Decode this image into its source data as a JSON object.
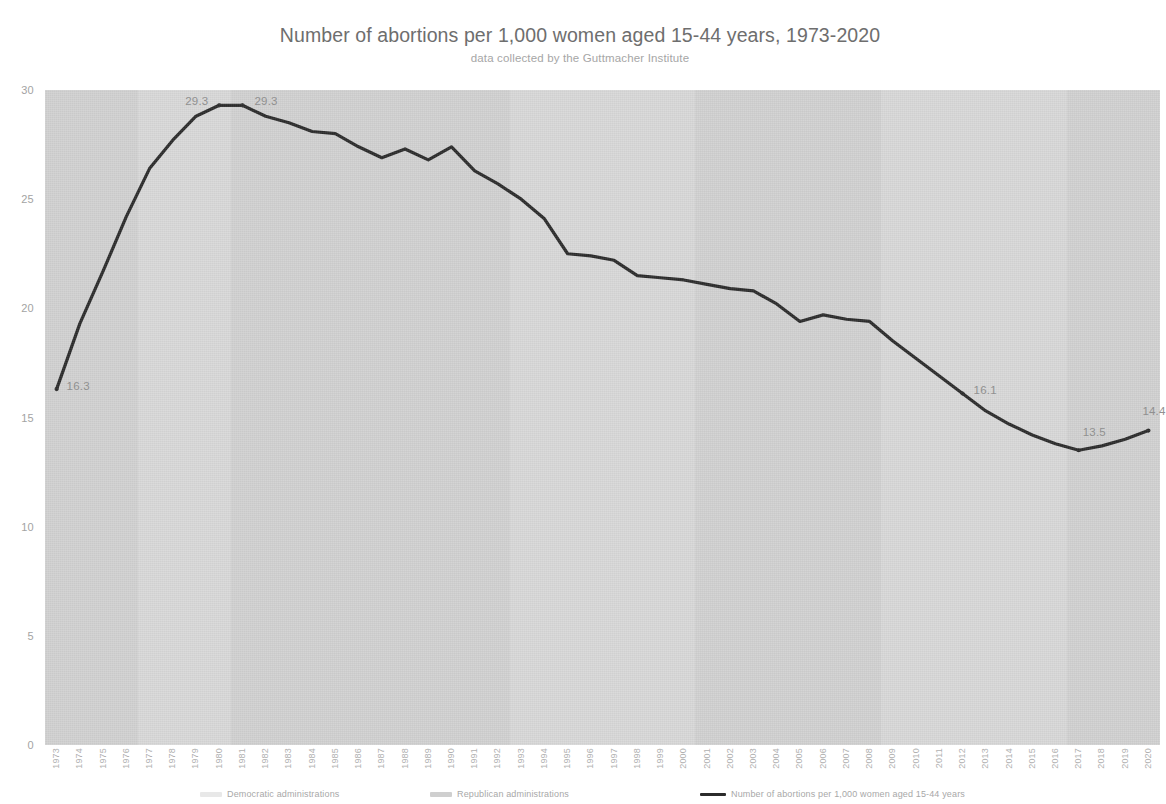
{
  "header": {
    "title": "Number of abortions per 1,000 women aged 15-44 years, 1973-2020",
    "subtitle": "data collected by the Guttmacher Institute"
  },
  "legend": [
    {
      "label": "Democratic administrations",
      "marker": "band-swatch",
      "color": "#e8e8e8"
    },
    {
      "label": "Republican administrations",
      "marker": "band-swatch",
      "color": "#cfcfcf"
    },
    {
      "label": "Number of abortions per 1,000 women aged 15-44 years",
      "marker": "line-swatch",
      "color": "#2b2b2b"
    }
  ],
  "colors": {
    "plot_background": "#d6d6d6",
    "line": "#2b2b2b",
    "axis_text": "#a8a8a8",
    "title_text": "#6e6e6e"
  },
  "chart_data": {
    "type": "line",
    "title": "Number of abortions per 1,000 women aged 15-44 years, 1973-2020",
    "subtitle": "data collected by the Guttmacher Institute",
    "xlabel": "",
    "ylabel": "",
    "ylim": [
      0,
      30
    ],
    "yticks": [
      0,
      5,
      10,
      15,
      20,
      25,
      30
    ],
    "ytick_labels": [
      "0",
      "5",
      "10",
      "15",
      "20",
      "25",
      "30"
    ],
    "grid": false,
    "legend_position": "bottom",
    "x": [
      1973,
      1974,
      1975,
      1976,
      1977,
      1978,
      1979,
      1980,
      1981,
      1982,
      1983,
      1984,
      1985,
      1986,
      1987,
      1988,
      1989,
      1990,
      1991,
      1992,
      1993,
      1994,
      1995,
      1996,
      1997,
      1998,
      1999,
      2000,
      2001,
      2002,
      2003,
      2004,
      2005,
      2006,
      2007,
      2008,
      2009,
      2010,
      2011,
      2012,
      2013,
      2014,
      2015,
      2016,
      2017,
      2018,
      2019,
      2020
    ],
    "categories": [
      "1973",
      "1974",
      "1975",
      "1976",
      "1977",
      "1978",
      "1979",
      "1980",
      "1981",
      "1982",
      "1983",
      "1984",
      "1985",
      "1986",
      "1987",
      "1988",
      "1989",
      "1990",
      "1991",
      "1992",
      "1993",
      "1994",
      "1995",
      "1996",
      "1997",
      "1998",
      "1999",
      "2000",
      "2001",
      "2002",
      "2003",
      "2004",
      "2005",
      "2006",
      "2007",
      "2008",
      "2009",
      "2010",
      "2011",
      "2012",
      "2013",
      "2014",
      "2015",
      "2016",
      "2017",
      "2018",
      "2019",
      "2020"
    ],
    "series": [
      {
        "name": "Number of abortions per 1,000 women aged 15-44 years",
        "color": "#2b2b2b",
        "values": [
          16.3,
          19.3,
          21.7,
          24.2,
          26.4,
          27.7,
          28.8,
          29.3,
          29.3,
          28.8,
          28.5,
          28.1,
          28.0,
          27.4,
          26.9,
          27.3,
          26.8,
          27.4,
          26.3,
          25.7,
          25.0,
          24.1,
          22.5,
          22.4,
          22.2,
          21.5,
          21.4,
          21.3,
          21.1,
          20.9,
          20.8,
          20.2,
          19.4,
          19.7,
          19.5,
          19.4,
          18.5,
          17.7,
          16.9,
          16.1,
          15.3,
          14.7,
          14.2,
          13.8,
          13.5,
          13.7,
          14.0,
          14.4
        ]
      }
    ],
    "point_labels": [
      {
        "year": 1973,
        "value": 16.3,
        "text": "16.3"
      },
      {
        "year": 1980,
        "value": 29.3,
        "text": "29.3"
      },
      {
        "year": 1981,
        "value": 29.3,
        "text": "29.3"
      },
      {
        "year": 2012,
        "value": 16.1,
        "text": "16.1"
      },
      {
        "year": 2017,
        "value": 13.5,
        "text": "13.5"
      },
      {
        "year": 2020,
        "value": 14.4,
        "text": "14.4"
      }
    ],
    "administration_bands": [
      {
        "party": "Republican",
        "start": 1973,
        "end": 1977
      },
      {
        "party": "Democratic",
        "start": 1977,
        "end": 1981
      },
      {
        "party": "Republican",
        "start": 1981,
        "end": 1993
      },
      {
        "party": "Democratic",
        "start": 1993,
        "end": 2001
      },
      {
        "party": "Republican",
        "start": 2001,
        "end": 2009
      },
      {
        "party": "Democratic",
        "start": 2009,
        "end": 2017
      },
      {
        "party": "Republican",
        "start": 2017,
        "end": 2021
      }
    ]
  }
}
